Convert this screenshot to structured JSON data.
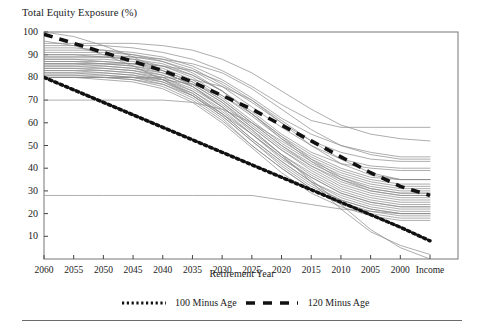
{
  "axes": {
    "y_title": "Total Equity Exposure (%)",
    "x_title": "Retirement Year",
    "y_ticks": [
      "100",
      "90",
      "80",
      "70",
      "60",
      "50",
      "40",
      "30",
      "20",
      "10"
    ],
    "x_ticks": [
      "2060",
      "2055",
      "2050",
      "2045",
      "2040",
      "2035",
      "2030",
      "2025",
      "2020",
      "2015",
      "2010",
      "2005",
      "2000",
      "Income"
    ]
  },
  "legend": {
    "items": [
      {
        "label": "100 Minus Age",
        "style": "dotted",
        "color": "#111111"
      },
      {
        "label": "120 Minus Age",
        "style": "dashed",
        "color": "#111111"
      }
    ]
  },
  "colors": {
    "glidepath_line": "#8a8a8a",
    "reference_line": "#111111",
    "axis": "#444444",
    "frame": "#777777"
  },
  "chart_data": {
    "type": "line",
    "title": "",
    "xlabel": "Retirement Year",
    "ylabel": "Total Equity Exposure (%)",
    "x": [
      "2060",
      "2055",
      "2050",
      "2045",
      "2040",
      "2035",
      "2030",
      "2025",
      "2020",
      "2015",
      "2010",
      "2005",
      "2000",
      "Income"
    ],
    "ylim": [
      0,
      100
    ],
    "xlim_categories": 14,
    "grid": false,
    "legend_position": "bottom",
    "series": [
      {
        "name": "100 Minus Age",
        "style": "dotted",
        "emphasis": true,
        "values": [
          80,
          74.5,
          69,
          63.5,
          58,
          52.5,
          47,
          41.5,
          36,
          30.5,
          25,
          19.5,
          14,
          8
        ]
      },
      {
        "name": "120 Minus Age",
        "style": "dashed",
        "emphasis": true,
        "values": [
          99,
          95,
          91,
          87,
          83,
          78,
          72,
          66,
          59,
          52,
          45,
          38,
          32,
          28
        ]
      },
      {
        "name": "Glide Path 1",
        "style": "solid",
        "values": [
          95,
          95,
          95,
          95,
          94,
          92,
          88,
          82,
          74,
          66,
          59,
          55,
          53,
          52
        ]
      },
      {
        "name": "Glide Path 2",
        "style": "solid",
        "values": [
          94,
          94,
          94,
          93,
          91,
          88,
          83,
          76,
          68,
          61,
          58,
          58,
          58,
          58
        ]
      },
      {
        "name": "Glide Path 3",
        "style": "solid",
        "values": [
          92,
          92,
          92,
          91,
          89,
          85,
          79,
          71,
          62,
          55,
          50,
          47,
          45,
          45
        ]
      },
      {
        "name": "Glide Path 4",
        "style": "solid",
        "values": [
          91,
          91,
          91,
          90,
          88,
          84,
          77,
          69,
          60,
          52,
          47,
          44,
          43,
          43
        ]
      },
      {
        "name": "Glide Path 5",
        "style": "solid",
        "values": [
          90,
          90,
          90,
          89,
          87,
          83,
          76,
          67,
          58,
          50,
          44,
          41,
          40,
          40
        ]
      },
      {
        "name": "Glide Path 6",
        "style": "solid",
        "values": [
          90,
          90,
          89,
          88,
          85,
          81,
          74,
          65,
          55,
          47,
          42,
          40,
          39,
          39
        ]
      },
      {
        "name": "Glide Path 7",
        "style": "solid",
        "values": [
          89,
          89,
          89,
          88,
          86,
          81,
          74,
          64,
          54,
          46,
          40,
          36,
          35,
          35
        ]
      },
      {
        "name": "Glide Path 8",
        "style": "solid",
        "values": [
          88,
          88,
          88,
          87,
          85,
          80,
          72,
          63,
          53,
          45,
          39,
          35,
          33,
          33
        ]
      },
      {
        "name": "Glide Path 9",
        "style": "solid",
        "values": [
          88,
          88,
          87,
          86,
          83,
          78,
          70,
          60,
          50,
          42,
          36,
          32,
          30,
          30
        ]
      },
      {
        "name": "Glide Path 10",
        "style": "solid",
        "values": [
          87,
          87,
          87,
          86,
          84,
          79,
          71,
          61,
          51,
          43,
          37,
          33,
          31,
          31
        ]
      },
      {
        "name": "Glide Path 11",
        "style": "solid",
        "values": [
          87,
          87,
          86,
          85,
          82,
          77,
          69,
          59,
          49,
          41,
          35,
          31,
          29,
          29
        ]
      },
      {
        "name": "Glide Path 12",
        "style": "solid",
        "values": [
          86,
          86,
          86,
          85,
          83,
          78,
          70,
          60,
          50,
          41,
          34,
          30,
          28,
          28
        ]
      },
      {
        "name": "Glide Path 13",
        "style": "solid",
        "values": [
          86,
          86,
          85,
          84,
          81,
          76,
          68,
          58,
          48,
          40,
          33,
          29,
          27,
          27
        ]
      },
      {
        "name": "Glide Path 14",
        "style": "solid",
        "values": [
          85,
          85,
          85,
          84,
          82,
          77,
          69,
          58,
          48,
          39,
          32,
          28,
          26,
          26
        ]
      },
      {
        "name": "Glide Path 15",
        "style": "solid",
        "values": [
          85,
          85,
          84,
          83,
          80,
          75,
          67,
          56,
          46,
          38,
          31,
          27,
          25,
          25
        ]
      },
      {
        "name": "Glide Path 16",
        "style": "solid",
        "values": [
          84,
          84,
          84,
          83,
          81,
          76,
          67,
          57,
          46,
          37,
          30,
          26,
          24,
          24
        ]
      },
      {
        "name": "Glide Path 17",
        "style": "solid",
        "values": [
          84,
          84,
          83,
          82,
          79,
          74,
          65,
          55,
          44,
          36,
          29,
          25,
          23,
          23
        ]
      },
      {
        "name": "Glide Path 18",
        "style": "solid",
        "values": [
          83,
          83,
          83,
          82,
          80,
          74,
          66,
          55,
          45,
          36,
          29,
          25,
          23,
          23
        ]
      },
      {
        "name": "Glide Path 19",
        "style": "solid",
        "values": [
          83,
          83,
          82,
          81,
          78,
          73,
          64,
          53,
          43,
          34,
          28,
          24,
          22,
          22
        ]
      },
      {
        "name": "Glide Path 20",
        "style": "solid",
        "values": [
          82,
          82,
          82,
          81,
          79,
          73,
          64,
          53,
          43,
          34,
          27,
          23,
          21,
          21
        ]
      },
      {
        "name": "Glide Path 21",
        "style": "solid",
        "values": [
          82,
          82,
          81,
          80,
          77,
          72,
          63,
          52,
          42,
          33,
          26,
          22,
          20,
          20
        ]
      },
      {
        "name": "Glide Path 22",
        "style": "solid",
        "values": [
          81,
          81,
          81,
          80,
          78,
          72,
          63,
          52,
          41,
          32,
          26,
          22,
          20,
          20
        ]
      },
      {
        "name": "Glide Path 23",
        "style": "solid",
        "values": [
          81,
          81,
          80,
          79,
          76,
          70,
          61,
          50,
          40,
          31,
          25,
          21,
          19,
          19
        ]
      },
      {
        "name": "Glide Path 24",
        "style": "solid",
        "values": [
          80,
          80,
          80,
          79,
          77,
          71,
          62,
          50,
          40,
          31,
          24,
          20,
          18,
          18
        ]
      },
      {
        "name": "Glide Path 25",
        "style": "solid",
        "values": [
          80,
          80,
          79,
          78,
          75,
          69,
          60,
          49,
          38,
          29,
          23,
          19,
          17,
          17
        ]
      },
      {
        "name": "Glide Path 26",
        "style": "solid",
        "values": [
          80,
          80,
          80,
          80,
          79,
          77,
          72,
          64,
          54,
          44,
          36,
          31,
          29,
          29
        ]
      },
      {
        "name": "Glide Path 27",
        "style": "solid",
        "values": [
          80,
          80,
          80,
          80,
          80,
          79,
          76,
          70,
          61,
          52,
          44,
          38,
          35,
          35
        ]
      },
      {
        "name": "Glide Path 28",
        "style": "solid",
        "values": [
          70,
          70,
          70,
          70,
          70,
          69,
          66,
          60,
          52,
          44,
          38,
          34,
          32,
          32
        ]
      },
      {
        "name": "Glide Path 29",
        "style": "solid",
        "values": [
          28,
          28,
          28,
          28,
          28,
          28,
          28,
          28,
          26,
          24,
          22,
          21,
          20,
          20
        ]
      },
      {
        "name": "Glide Path 30",
        "style": "solid",
        "values": [
          96,
          94,
          90,
          85,
          79,
          72,
          64,
          55,
          45,
          35,
          24,
          13,
          5,
          0
        ]
      },
      {
        "name": "Glide Path 31",
        "style": "solid",
        "values": [
          100,
          98,
          94,
          89,
          83,
          76,
          67,
          57,
          46,
          34,
          22,
          12,
          6,
          2
        ]
      },
      {
        "name": "Glide Path 32",
        "style": "solid",
        "values": [
          86,
          86,
          86,
          86,
          85,
          83,
          78,
          70,
          60,
          50,
          42,
          37,
          35,
          35
        ]
      },
      {
        "name": "Glide Path 33",
        "style": "solid",
        "values": [
          89,
          89,
          89,
          89,
          88,
          86,
          82,
          75,
          66,
          57,
          50,
          46,
          44,
          44
        ]
      },
      {
        "name": "Glide Path 34",
        "style": "solid",
        "values": [
          93,
          93,
          92,
          90,
          87,
          82,
          74,
          64,
          53,
          43,
          35,
          30,
          28,
          28
        ]
      }
    ]
  }
}
